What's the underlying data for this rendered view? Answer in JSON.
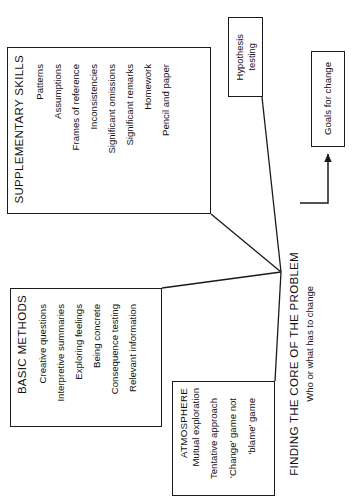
{
  "diagram": {
    "title": "FINDING THE CORE OF THE PROBLEM",
    "subtitle": "Who or what has to change",
    "orientation": "rotated-90-ccw",
    "colors": {
      "stroke": "#1a1a1a",
      "text": "#111111",
      "background": "#ffffff"
    }
  },
  "boxes": {
    "supplementary": {
      "heading": "SUPPLEMENTARY SKILLS",
      "items": [
        "Patterns",
        "Assumptions",
        "Frames of reference",
        "Inconsistencies",
        "Significant omissions",
        "Significant remarks",
        "Homework",
        "Pencil and paper"
      ]
    },
    "basic": {
      "heading": "BASIC METHODS",
      "items": [
        "Creative questions",
        "Interpretive summaries",
        "Exploring feelings",
        "Being concrete",
        "Consequence testing",
        "Relevant information"
      ]
    },
    "atmosphere": {
      "heading": "ATMOSPHERE",
      "items": [
        "Mutual exploration",
        "Tentative approach",
        "'Change' game not",
        "'blame' game"
      ]
    },
    "hypothesis": {
      "line1": "Hypothesis",
      "line2": "testing"
    },
    "goals": {
      "label": "Goals for change"
    }
  },
  "connectors": [
    {
      "name": "supplementary-to-core",
      "from": "supplementary",
      "to": "core-node",
      "arrow": false
    },
    {
      "name": "basic-to-core",
      "from": "basic",
      "to": "core-node",
      "arrow": false
    },
    {
      "name": "atmosphere-to-core",
      "from": "atmosphere",
      "to": "core-node",
      "arrow": false
    },
    {
      "name": "hypothesis-to-core",
      "from": "hypothesis",
      "to": "core-node",
      "arrow": false
    },
    {
      "name": "core-to-goals",
      "from": "core-node",
      "to": "goals",
      "arrow": true
    }
  ]
}
